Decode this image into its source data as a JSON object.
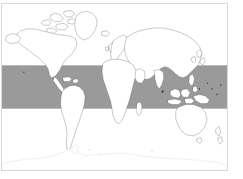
{
  "figure": {
    "frame_border_color": "#d8d8d8",
    "background_color": "#ffffff"
  },
  "chart_data": {
    "type": "map",
    "projection": "equirectangular",
    "title": "",
    "xlabel": "",
    "ylabel": "",
    "xlim": [
      -180,
      180
    ],
    "ylim": [
      -90,
      90
    ],
    "grid": false,
    "legend": "none",
    "tick_labels_x": [],
    "tick_labels_y": [],
    "annotations": [],
    "layers": [
      {
        "name": "highlight-band",
        "kind": "latitude-band",
        "label": "",
        "color": "#9a9a9a",
        "lat_min": -23.5,
        "lat_max": 23.5,
        "lon_min": -180,
        "lon_max": 180
      },
      {
        "name": "landmass-outlines",
        "kind": "coastline",
        "label": "",
        "fill": "#ffffff",
        "stroke": "#4a4a4a"
      },
      {
        "name": "antarctica-outline",
        "kind": "coastline",
        "label": "",
        "fill": "#ffffff",
        "stroke": "#cdcdcd"
      }
    ],
    "regions": [
      "North America",
      "Greenland",
      "Canadian Arctic Archipelago",
      "Central America",
      "Caribbean",
      "South America",
      "Europe",
      "Africa",
      "Madagascar",
      "Asia",
      "Arabian Peninsula",
      "India",
      "Japan",
      "Philippines",
      "Indonesia",
      "New Guinea",
      "Australia",
      "New Zealand",
      "Antarctica",
      "Iceland",
      "British Isles"
    ]
  },
  "colors": {
    "band": "#9a9a9a",
    "land_fill": "#ffffff",
    "land_stroke": "#4a4a4a",
    "faint_stroke": "#cdcdcd",
    "frame": "#d8d8d8",
    "page": "#ffffff"
  }
}
